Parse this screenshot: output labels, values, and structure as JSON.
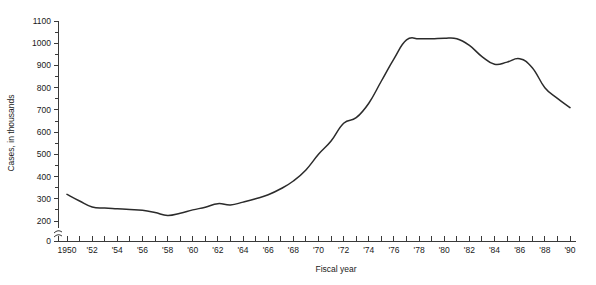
{
  "chart_data": {
    "type": "line",
    "title": "",
    "xlabel": "Fiscal year",
    "ylabel": "Cases, in thousands",
    "xlim": [
      1950,
      1990
    ],
    "ylim": [
      200,
      1100
    ],
    "y_axis_break": true,
    "y_axis_break_note": "axis broken between 0 and 200",
    "grid": false,
    "legend": false,
    "y_ticks": [
      {
        "value": 0,
        "label": "0"
      },
      {
        "value": 200,
        "label": "200"
      },
      {
        "value": 300,
        "label": "300"
      },
      {
        "value": 400,
        "label": "400"
      },
      {
        "value": 500,
        "label": "500"
      },
      {
        "value": 600,
        "label": "600"
      },
      {
        "value": 700,
        "label": "700"
      },
      {
        "value": 800,
        "label": "800"
      },
      {
        "value": 900,
        "label": "900"
      },
      {
        "value": 1000,
        "label": "1000"
      },
      {
        "value": 1100,
        "label": "1100"
      }
    ],
    "x_ticks": [
      {
        "value": 1950,
        "label": "1950"
      },
      {
        "value": 1951,
        "label": ""
      },
      {
        "value": 1952,
        "label": "'52"
      },
      {
        "value": 1953,
        "label": ""
      },
      {
        "value": 1954,
        "label": "'54"
      },
      {
        "value": 1955,
        "label": ""
      },
      {
        "value": 1956,
        "label": "'56"
      },
      {
        "value": 1957,
        "label": ""
      },
      {
        "value": 1958,
        "label": "'58"
      },
      {
        "value": 1959,
        "label": ""
      },
      {
        "value": 1960,
        "label": "'60"
      },
      {
        "value": 1961,
        "label": ""
      },
      {
        "value": 1962,
        "label": "'62"
      },
      {
        "value": 1963,
        "label": ""
      },
      {
        "value": 1964,
        "label": "'64"
      },
      {
        "value": 1965,
        "label": ""
      },
      {
        "value": 1966,
        "label": "'66"
      },
      {
        "value": 1967,
        "label": ""
      },
      {
        "value": 1968,
        "label": "'68"
      },
      {
        "value": 1969,
        "label": ""
      },
      {
        "value": 1970,
        "label": "'70"
      },
      {
        "value": 1971,
        "label": ""
      },
      {
        "value": 1972,
        "label": "'72"
      },
      {
        "value": 1973,
        "label": ""
      },
      {
        "value": 1974,
        "label": "'74"
      },
      {
        "value": 1975,
        "label": ""
      },
      {
        "value": 1976,
        "label": "'76"
      },
      {
        "value": 1977,
        "label": ""
      },
      {
        "value": 1978,
        "label": "'78"
      },
      {
        "value": 1979,
        "label": ""
      },
      {
        "value": 1980,
        "label": "'80"
      },
      {
        "value": 1981,
        "label": ""
      },
      {
        "value": 1982,
        "label": "'82"
      },
      {
        "value": 1983,
        "label": ""
      },
      {
        "value": 1984,
        "label": "'84"
      },
      {
        "value": 1985,
        "label": ""
      },
      {
        "value": 1986,
        "label": "'86"
      },
      {
        "value": 1987,
        "label": ""
      },
      {
        "value": 1988,
        "label": "'88"
      },
      {
        "value": 1989,
        "label": ""
      },
      {
        "value": 1990,
        "label": "'90"
      }
    ],
    "x": [
      1950,
      1951,
      1952,
      1953,
      1954,
      1955,
      1956,
      1957,
      1958,
      1959,
      1960,
      1961,
      1962,
      1963,
      1964,
      1965,
      1966,
      1967,
      1968,
      1969,
      1970,
      1971,
      1972,
      1973,
      1974,
      1975,
      1976,
      1977,
      1978,
      1979,
      1980,
      1981,
      1982,
      1983,
      1984,
      1985,
      1986,
      1987,
      1988,
      1989,
      1990
    ],
    "values": [
      320,
      290,
      263,
      258,
      255,
      252,
      248,
      238,
      225,
      235,
      250,
      262,
      278,
      272,
      285,
      300,
      318,
      345,
      380,
      430,
      500,
      560,
      640,
      665,
      730,
      830,
      930,
      1015,
      1020,
      1020,
      1022,
      1020,
      990,
      940,
      905,
      915,
      930,
      890,
      800,
      752,
      710
    ],
    "series": [
      {
        "name": "Cases",
        "color": "#2b2b2b",
        "values": [
          320,
          290,
          263,
          258,
          255,
          252,
          248,
          238,
          225,
          235,
          250,
          262,
          278,
          272,
          285,
          300,
          318,
          345,
          380,
          430,
          500,
          560,
          640,
          665,
          730,
          830,
          930,
          1015,
          1020,
          1020,
          1022,
          1020,
          990,
          940,
          905,
          915,
          930,
          890,
          800,
          752,
          710
        ]
      }
    ]
  }
}
